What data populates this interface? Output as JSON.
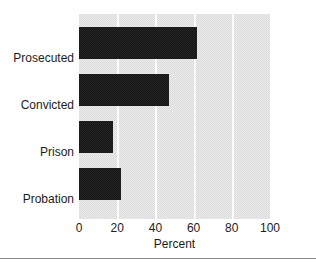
{
  "chart_data": {
    "type": "bar",
    "orientation": "horizontal",
    "title": "",
    "xlabel": "Percent",
    "ylabel": "",
    "categories": [
      "Prosecuted",
      "Convicted",
      "Prison",
      "Probation"
    ],
    "values": [
      62,
      47,
      18,
      22
    ],
    "xlim": [
      0,
      100
    ],
    "xticks": [
      0,
      20,
      40,
      60,
      80,
      100
    ],
    "xtick_labels": [
      "0",
      "20",
      "40",
      "60",
      "80",
      "100"
    ],
    "gridlines": [
      20,
      40,
      60,
      80
    ],
    "grid": true,
    "legend": null,
    "series": [
      {
        "name": "Percent",
        "values": [
          62,
          47,
          18,
          22
        ]
      }
    ],
    "colors": {
      "bar": "#1b1b1b",
      "plot_background": "#e3e3e3",
      "gridline": "#fbfbfb",
      "text": "#1c1c1c",
      "figure_background": "#ffffff",
      "rule": "#8d8d8d"
    }
  }
}
